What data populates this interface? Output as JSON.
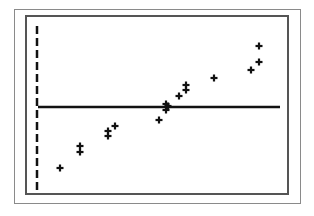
{
  "chart_data": {
    "type": "scatter",
    "title": "",
    "xlabel": "",
    "ylabel": "",
    "grid": false,
    "legend": null,
    "marker": "plus",
    "axes": {
      "y_axis_style": "dashed",
      "x_axis_style": "solid"
    },
    "points_px": [
      {
        "x": 60,
        "y": 168
      },
      {
        "x": 80,
        "y": 146
      },
      {
        "x": 80,
        "y": 152
      },
      {
        "x": 108,
        "y": 131
      },
      {
        "x": 108,
        "y": 136
      },
      {
        "x": 115,
        "y": 126
      },
      {
        "x": 159,
        "y": 120
      },
      {
        "x": 166,
        "y": 104
      },
      {
        "x": 166,
        "y": 110
      },
      {
        "x": 168,
        "y": 106
      },
      {
        "x": 179,
        "y": 96
      },
      {
        "x": 186,
        "y": 85
      },
      {
        "x": 186,
        "y": 90
      },
      {
        "x": 214,
        "y": 78
      },
      {
        "x": 251,
        "y": 70
      },
      {
        "x": 259,
        "y": 62
      },
      {
        "x": 259,
        "y": 46
      }
    ],
    "x": [
      1,
      2,
      2,
      3,
      3,
      3.3,
      5,
      5.3,
      5.3,
      5.4,
      5.8,
      6.1,
      6.1,
      7.2,
      8.7,
      9,
      9
    ],
    "y": [
      -2.3,
      -1.3,
      -1.6,
      -0.8,
      -1.0,
      -0.6,
      -0.5,
      0.1,
      -0.1,
      0.0,
      0.4,
      0.8,
      0.6,
      1.1,
      1.4,
      1.7,
      2.4
    ],
    "horizontal_line": {
      "y": 0,
      "y_px": 107,
      "x_start_px": 38,
      "x_end_px": 280
    },
    "vertical_axis": {
      "x_px": 37,
      "y_start_px": 26,
      "y_end_px": 190
    }
  }
}
